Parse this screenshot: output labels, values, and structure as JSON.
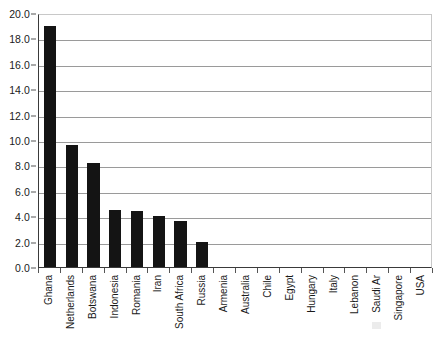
{
  "chart_data": {
    "type": "bar",
    "title": "",
    "subtitle": "",
    "xlabel": "",
    "ylabel": "",
    "grid": true,
    "legend": false,
    "legend_position": "none",
    "bar_color": "#141414",
    "gridline_color": "#9a9a9a",
    "axis_color": "#3a3a3a",
    "ylim": [
      0.0,
      20.0
    ],
    "ytick_step": 2.0,
    "ytick_labels": [
      "0.0",
      "2.0",
      "4.0",
      "6.0",
      "8.0",
      "10.0",
      "12.0",
      "14.0",
      "16.0",
      "18.0",
      "20.0"
    ],
    "ytick_values": [
      0.0,
      2.0,
      4.0,
      6.0,
      8.0,
      10.0,
      12.0,
      14.0,
      16.0,
      18.0,
      20.0
    ],
    "categories": [
      "Ghana",
      "Netherlands",
      "Botswana",
      "Indonesia",
      "Romania",
      "Iran",
      "South Africa",
      "Russia",
      "Armenia",
      "Australia",
      "Chile",
      "Egypt",
      "Hungary",
      "Italy",
      "Lebanon",
      "Saudi Ar",
      "Singapore",
      "USA"
    ],
    "values": [
      19.0,
      9.6,
      8.2,
      4.5,
      4.4,
      4.0,
      3.6,
      2.0,
      0.0,
      0.0,
      0.0,
      0.0,
      0.0,
      0.0,
      0.0,
      0.0,
      0.0,
      0.0
    ]
  }
}
